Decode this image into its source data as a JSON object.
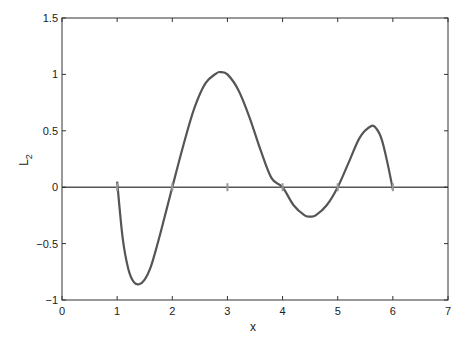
{
  "chart_data": {
    "type": "line",
    "title": "",
    "xlabel": "x",
    "ylabel": "L",
    "ylabel_subscript": "2",
    "xlim": [
      0,
      7
    ],
    "ylim": [
      -1,
      1.5
    ],
    "grid": false,
    "legend": null,
    "xticks": [
      "0",
      "1",
      "2",
      "3",
      "4",
      "5",
      "6",
      "7"
    ],
    "yticks": [
      "-1",
      "-0.5",
      "0",
      "0.5",
      "1",
      "1.5"
    ],
    "series": [
      {
        "name": "L_2",
        "color": "#555555",
        "x": [
          1.0,
          1.1,
          1.2,
          1.3,
          1.4,
          1.5,
          1.6,
          1.7,
          1.8,
          1.9,
          2.0,
          2.2,
          2.4,
          2.6,
          2.8,
          2.87,
          3.0,
          3.2,
          3.4,
          3.6,
          3.8,
          4.0,
          4.2,
          4.4,
          4.5,
          4.6,
          4.8,
          5.0,
          5.2,
          5.4,
          5.6,
          5.7,
          5.8,
          5.9,
          6.0
        ],
        "values": [
          0.05,
          -0.45,
          -0.72,
          -0.84,
          -0.86,
          -0.82,
          -0.72,
          -0.56,
          -0.38,
          -0.19,
          0.0,
          0.37,
          0.7,
          0.92,
          1.01,
          1.02,
          1.0,
          0.86,
          0.62,
          0.33,
          0.08,
          0.0,
          -0.16,
          -0.25,
          -0.26,
          -0.25,
          -0.16,
          0.0,
          0.22,
          0.44,
          0.54,
          0.52,
          0.42,
          0.22,
          -0.02
        ]
      },
      {
        "name": "zero line",
        "color": "#555555",
        "x": [
          0,
          7
        ],
        "values": [
          0,
          0
        ]
      }
    ],
    "markers": {
      "x": [
        1,
        2,
        3,
        4,
        5,
        6
      ],
      "y": [
        0,
        0,
        0,
        0,
        0,
        0
      ],
      "color": "#999999"
    }
  }
}
